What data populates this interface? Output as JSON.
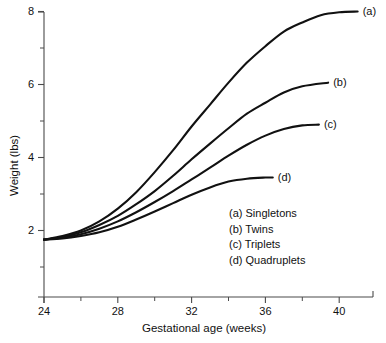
{
  "chart_data": {
    "type": "line",
    "title": "",
    "xlabel": "Gestational age (weeks)",
    "ylabel": "Weight (lbs)",
    "xlim": [
      24,
      41.8
    ],
    "ylim": [
      0.0,
      8.3
    ],
    "grid": false,
    "legend_position": "inside-lower-right",
    "x_major_ticks": [
      24,
      28,
      32,
      36,
      40
    ],
    "x_minor_ticks": [
      26,
      30,
      34,
      38
    ],
    "x_ticklabels": [
      "24",
      "28",
      "32",
      "36",
      "40"
    ],
    "y_major_ticks": [
      2,
      4,
      6,
      8
    ],
    "y_minor_ticks": [
      1,
      3,
      5,
      7
    ],
    "y_ticklabels": [
      "2",
      "4",
      "6",
      "8"
    ],
    "series": [
      {
        "key": "a",
        "name": "Singletons",
        "end_label": "(a)",
        "x": [
          24,
          25,
          26,
          27,
          28,
          29,
          30,
          31,
          32,
          33,
          34,
          35,
          36,
          37,
          38,
          39,
          40,
          41
        ],
        "y": [
          1.75,
          1.85,
          2.0,
          2.25,
          2.6,
          3.05,
          3.6,
          4.2,
          4.85,
          5.45,
          6.05,
          6.6,
          7.05,
          7.45,
          7.7,
          7.9,
          7.98,
          8.0
        ]
      },
      {
        "key": "b",
        "name": "Twins",
        "end_label": "(b)",
        "x": [
          24,
          25,
          26,
          27,
          28,
          29,
          30,
          31,
          32,
          33,
          34,
          35,
          36,
          37,
          38,
          39.4
        ],
        "y": [
          1.75,
          1.82,
          1.95,
          2.15,
          2.4,
          2.72,
          3.08,
          3.5,
          3.95,
          4.38,
          4.8,
          5.2,
          5.5,
          5.78,
          5.95,
          6.05
        ]
      },
      {
        "key": "c",
        "name": "Triplets",
        "end_label": "(c)",
        "x": [
          24,
          25,
          26,
          27,
          28,
          29,
          30,
          31,
          32,
          33,
          34,
          35,
          36,
          37,
          38,
          38.9
        ],
        "y": [
          1.75,
          1.8,
          1.9,
          2.05,
          2.25,
          2.5,
          2.78,
          3.08,
          3.4,
          3.72,
          4.05,
          4.35,
          4.6,
          4.78,
          4.88,
          4.9
        ]
      },
      {
        "key": "d",
        "name": "Quadruplets",
        "end_label": "(d)",
        "x": [
          24,
          25,
          26,
          27,
          28,
          29,
          30,
          31,
          32,
          33,
          34,
          35,
          36,
          36.4
        ],
        "y": [
          1.75,
          1.78,
          1.85,
          1.95,
          2.1,
          2.3,
          2.52,
          2.75,
          2.98,
          3.18,
          3.34,
          3.42,
          3.45,
          3.45
        ]
      }
    ],
    "legend_entries": [
      "(a) Singletons",
      "(b) Twins",
      "(c) Triplets",
      "(d) Quadruplets"
    ],
    "line_color": "#111111"
  }
}
